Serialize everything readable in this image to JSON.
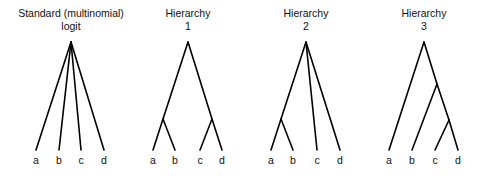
{
  "diagrams": [
    {
      "title_line1": "Standard (multinomial)",
      "title_line2": "logit",
      "leaves": [
        "a",
        "b",
        "c",
        "d"
      ]
    },
    {
      "title_line1": "Hierarchy",
      "title_line2": "1",
      "leaves": [
        "a",
        "b",
        "c",
        "d"
      ]
    },
    {
      "title_line1": "Hierarchy",
      "title_line2": "2",
      "leaves": [
        "a",
        "b",
        "c",
        "d"
      ]
    },
    {
      "title_line1": "Hierarchy",
      "title_line2": "3",
      "leaves": [
        "a",
        "b",
        "c",
        "d"
      ]
    }
  ],
  "colors": {
    "line": "#000000",
    "text": "#111111",
    "background": "#ffffff"
  }
}
